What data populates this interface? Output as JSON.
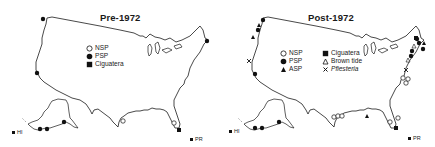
{
  "figure": {
    "panels": [
      {
        "title": "Pre-1972",
        "legend": [
          {
            "symbol": "open-circle",
            "label": "NSP"
          },
          {
            "symbol": "filled-circle",
            "label": "PSP"
          },
          {
            "symbol": "filled-square",
            "label": "Ciguatera"
          }
        ],
        "region_labels": {
          "hawaii": "HI",
          "puerto_rico": "PR"
        }
      },
      {
        "title": "Post-1972",
        "legend_left": [
          {
            "symbol": "open-circle",
            "label": "NSP"
          },
          {
            "symbol": "filled-circle",
            "label": "PSP"
          },
          {
            "symbol": "filled-triangle",
            "label": "ASP"
          }
        ],
        "legend_right": [
          {
            "symbol": "filled-square",
            "label": "Ciguatera"
          },
          {
            "symbol": "open-triangle",
            "label": "Brown tide"
          },
          {
            "symbol": "x-mark",
            "label": "Pfiesteria"
          }
        ],
        "region_labels": {
          "hawaii": "HI",
          "puerto_rico": "PR"
        }
      }
    ],
    "colors": {
      "ink": "#1a1a1a",
      "background": "#ffffff"
    }
  }
}
